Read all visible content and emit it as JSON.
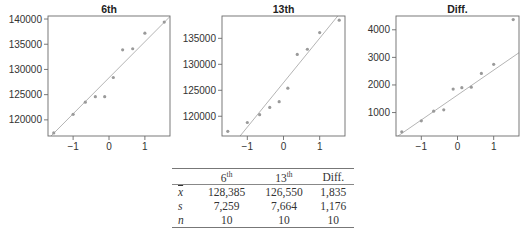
{
  "chart_data": [
    {
      "type": "scatter",
      "subtype": "normal-probability-plot",
      "title": "6th",
      "xlabel": "",
      "ylabel": "",
      "xlim": [
        -1.7,
        1.7
      ],
      "ylim": [
        116800,
        140600
      ],
      "xticks": [
        -1,
        0,
        1
      ],
      "yticks": [
        120000,
        125000,
        130000,
        135000,
        140000
      ],
      "grid": false,
      "x": [
        -1.54,
        -1.0,
        -0.66,
        -0.38,
        -0.12,
        0.12,
        0.38,
        0.66,
        1.0,
        1.54
      ],
      "y": [
        117400,
        121100,
        123500,
        124600,
        124600,
        128400,
        133900,
        134100,
        137200,
        139400
      ],
      "fit_line": {
        "x": [
          -1.7,
          1.7
        ],
        "y": [
          116200,
          140500
        ]
      }
    },
    {
      "type": "scatter",
      "subtype": "normal-probability-plot",
      "title": "13th",
      "xlabel": "",
      "ylabel": "",
      "xlim": [
        -1.7,
        1.7
      ],
      "ylim": [
        116200,
        139300
      ],
      "xticks": [
        -1,
        0,
        1
      ],
      "yticks": [
        120000,
        125000,
        130000,
        135000
      ],
      "grid": false,
      "x": [
        -1.54,
        -1.0,
        -0.66,
        -0.38,
        -0.12,
        0.12,
        0.38,
        0.66,
        1.0,
        1.54
      ],
      "y": [
        117100,
        118800,
        120300,
        121700,
        122800,
        125400,
        131900,
        132900,
        136100,
        138500
      ],
      "fit_line": {
        "x": [
          -1.2,
          1.5
        ],
        "y": [
          116200,
          139300
        ]
      }
    },
    {
      "type": "scatter",
      "subtype": "normal-probability-plot",
      "title": "Diff.",
      "xlabel": "",
      "ylabel": "",
      "xlim": [
        -1.7,
        1.7
      ],
      "ylim": [
        150,
        4500
      ],
      "xticks": [
        -1,
        0,
        1
      ],
      "yticks": [
        1000,
        2000,
        3000,
        4000
      ],
      "grid": false,
      "x": [
        -1.54,
        -1.0,
        -0.66,
        -0.38,
        -0.12,
        0.12,
        0.38,
        0.66,
        1.0,
        1.54
      ],
      "y": [
        300,
        700,
        1050,
        1100,
        1850,
        1900,
        1920,
        2420,
        2750,
        4370
      ],
      "fit_line": {
        "x": [
          -1.7,
          1.7
        ],
        "y": [
          100,
          3170
        ]
      }
    }
  ],
  "table": {
    "headers": [
      "",
      "6",
      "13",
      "Diff."
    ],
    "header_sups": [
      "",
      "th",
      "th",
      ""
    ],
    "rows": [
      {
        "label": "x",
        "values": [
          "128,385",
          "126,550",
          "1,835"
        ]
      },
      {
        "label": "s",
        "values": [
          "7,259",
          "7,664",
          "1,176"
        ]
      },
      {
        "label": "n",
        "values": [
          "10",
          "10",
          "10"
        ]
      }
    ]
  }
}
